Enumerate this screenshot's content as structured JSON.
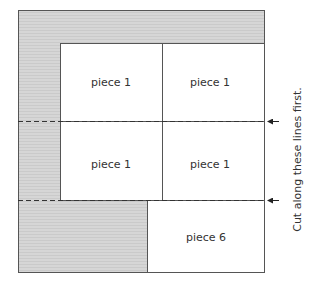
{
  "diagram": {
    "colors": {
      "background": "#ffffff",
      "shaded": "#d4d4d4",
      "stroke": "#555555",
      "text": "#333333"
    },
    "pieces": [
      {
        "label": "piece 1",
        "position": "top-left"
      },
      {
        "label": "piece 1",
        "position": "top-right"
      },
      {
        "label": "piece 1",
        "position": "middle-left"
      },
      {
        "label": "piece 1",
        "position": "middle-right"
      },
      {
        "label": "piece 6",
        "position": "bottom-right"
      }
    ],
    "annotation": "Cut along these lines first."
  }
}
